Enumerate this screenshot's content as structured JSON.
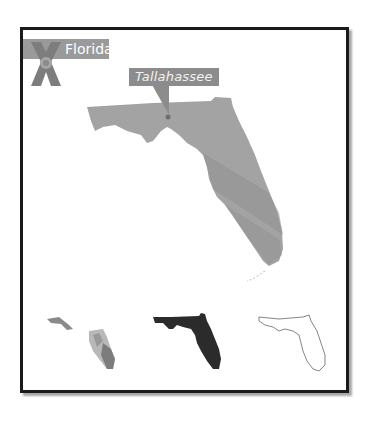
{
  "badge": {
    "label": "Florida",
    "icon": "florida-flag-icon",
    "background": "#9a9a9a"
  },
  "main_map": {
    "state": "Florida",
    "fill": "#a3a3a3",
    "shade": "#8f8f8f",
    "capital": {
      "label": "Tallahassee",
      "marker_color": "#7a7a7a",
      "callout_background": "#8c8c8c"
    }
  },
  "variants": [
    {
      "name": "photo-textured",
      "fill": "#8a8a8a"
    },
    {
      "name": "solid-silhouette",
      "fill": "#2b2b2b"
    },
    {
      "name": "outline",
      "stroke": "#777777"
    }
  ],
  "frame": {
    "border_color": "#1a1a1a"
  }
}
